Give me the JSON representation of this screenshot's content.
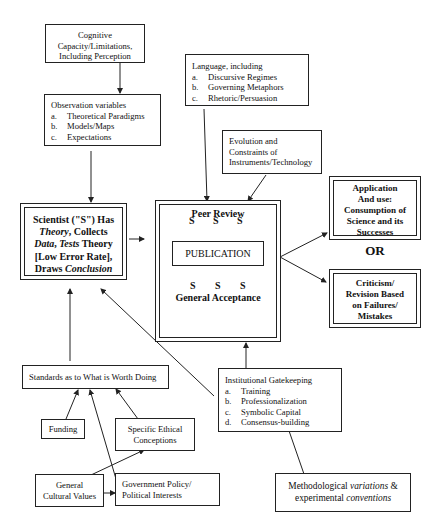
{
  "diagram": {
    "cognitive": {
      "lines": [
        "Cognitive",
        "Capacity/Limitations,",
        "Including Perception"
      ]
    },
    "observation": {
      "title": "Observation variables",
      "items": [
        {
          "key": "a.",
          "label": "Theoretical Paradigms"
        },
        {
          "key": "b.",
          "label": "Models/Maps"
        },
        {
          "key": "c.",
          "label": "Expectations"
        }
      ]
    },
    "language": {
      "title": "Language, including",
      "items": [
        {
          "key": "a.",
          "label": "Discursive Regimes"
        },
        {
          "key": "b.",
          "label": "Governing Metaphors"
        },
        {
          "key": "c.",
          "label": "Rhetoric/Persuasion"
        }
      ]
    },
    "evolution": {
      "lines": [
        "Evolution and",
        "Constraints of",
        "Instruments/Technology"
      ]
    },
    "scientist": {
      "l1": "Scientist (\"S\") Has",
      "l2_italic": "Theory",
      "l2_rest": ", Collects",
      "l3_italic1": "Data",
      "l3_mid": ", ",
      "l3_italic2": "Tests",
      "l3_rest": " Theory",
      "l4": "[Low Error Rate],",
      "l5_pre": "Draws ",
      "l5_italic": "Conclusion"
    },
    "peer_review": {
      "title": "Peer Review",
      "s_label": "S",
      "publication": "PUBLICATION",
      "footer": "General Acceptance"
    },
    "application": {
      "lines": [
        "Application",
        "And use:",
        "Consumption of",
        "Science and its",
        "Successes"
      ]
    },
    "or_label": "OR",
    "criticism": {
      "lines": [
        "Criticism/",
        "Revision Based",
        "on Failures/",
        "Mistakes"
      ]
    },
    "standards": {
      "label": "Standards as to What is Worth Doing"
    },
    "funding": {
      "label": "Funding"
    },
    "ethical": {
      "lines": [
        "Specific Ethical",
        "Conceptions"
      ]
    },
    "cultural": {
      "lines": [
        "General",
        "Cultural Values"
      ]
    },
    "government": {
      "lines": [
        "Government Policy/",
        "Political Interests"
      ]
    },
    "gatekeeping": {
      "title": "Institutional Gatekeeping",
      "items": [
        {
          "key": "a.",
          "label": "Training"
        },
        {
          "key": "b.",
          "label": "Professionalization"
        },
        {
          "key": "c.",
          "label": "Symbolic Capital"
        },
        {
          "key": "d.",
          "label": "Consensus-building"
        }
      ]
    },
    "methodological": {
      "l1_pre": "Methodological ",
      "l1_italic": "variations",
      "l1_post": " &",
      "l2_pre": "experimental ",
      "l2_italic": "conventions"
    },
    "colors": {
      "line": "#222222",
      "background": "#ffffff"
    }
  }
}
